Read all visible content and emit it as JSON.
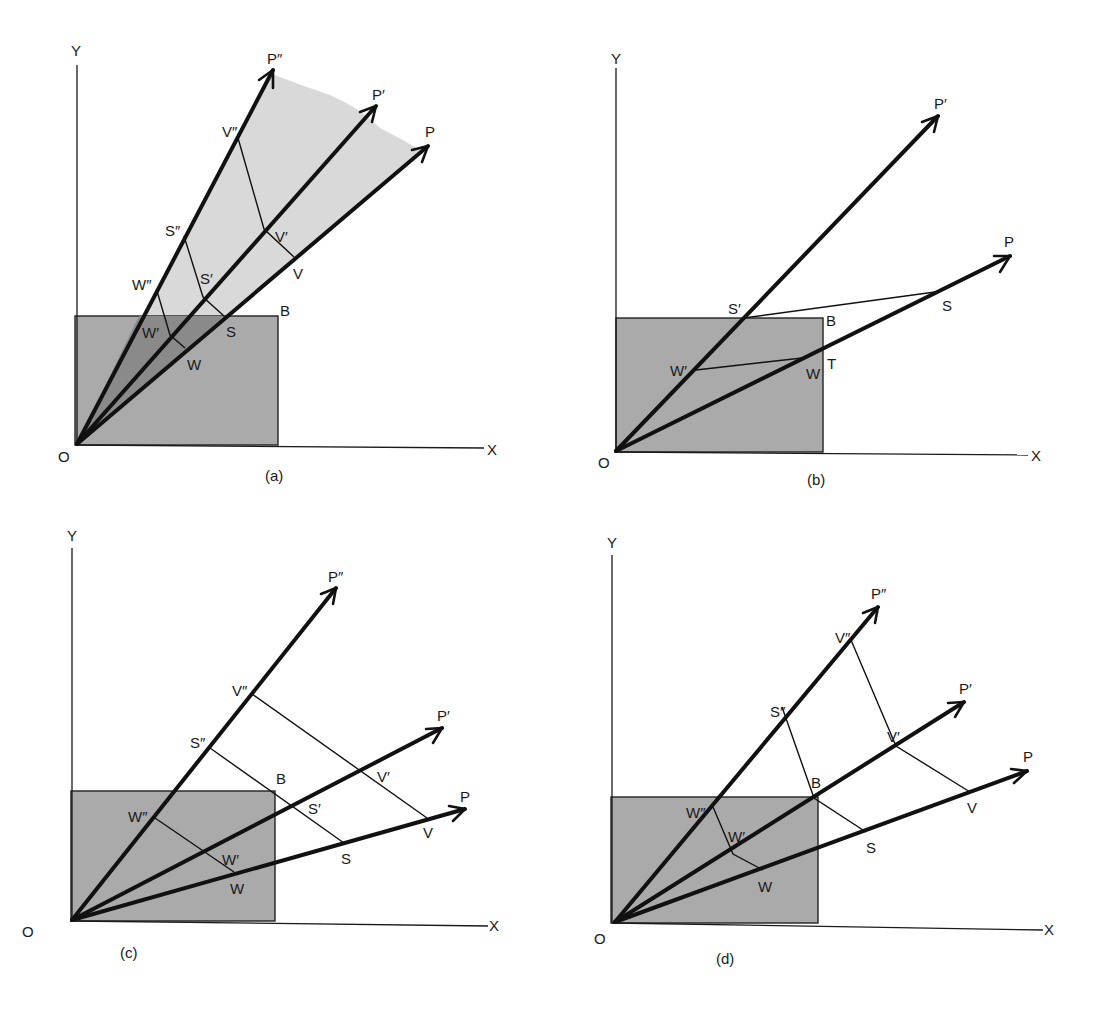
{
  "figure": {
    "panels": [
      {
        "id": "a",
        "caption": "(a)",
        "axes": {
          "x_label": "X",
          "y_label": "Y",
          "origin_label": "O"
        },
        "box_corner_label": "B",
        "rays": [
          "P″",
          "P′",
          "P"
        ],
        "points": {
          "W″": "W″",
          "W′": "W′",
          "W": "W",
          "S″": "S″",
          "S′": "S′",
          "S": "S",
          "V″": "V″",
          "V′": "V′",
          "V": "V"
        },
        "shading": "light fan region above box between P″ and P; darker wedge inside box"
      },
      {
        "id": "b",
        "caption": "(b)",
        "axes": {
          "x_label": "X",
          "y_label": "Y",
          "origin_label": "O"
        },
        "box_corner_label": "B",
        "rays": [
          "P′",
          "P"
        ],
        "points": {
          "S′": "S′",
          "S": "S",
          "W′": "W′",
          "W": "W",
          "T": "T"
        }
      },
      {
        "id": "c",
        "caption": "(c)",
        "axes": {
          "x_label": "X",
          "y_label": "Y",
          "origin_label": "O"
        },
        "box_corner_label": "B",
        "rays": [
          "P″",
          "P′",
          "P"
        ],
        "points": {
          "W″": "W″",
          "W′": "W′",
          "W": "W",
          "S″": "S″",
          "S′": "S′",
          "S": "S",
          "V″": "V″",
          "V′": "V′",
          "V": "V"
        }
      },
      {
        "id": "d",
        "caption": "(d)",
        "axes": {
          "x_label": "X",
          "y_label": "Y",
          "origin_label": "O"
        },
        "box_corner_label": "B",
        "rays": [
          "P″",
          "P′",
          "P"
        ],
        "points": {
          "W″": "W″",
          "W′": "W′",
          "W": "W",
          "S″": "S″",
          "S": "S",
          "V″": "V″",
          "V′": "V′",
          "V": "V"
        }
      }
    ],
    "colors": {
      "box_fill": "#aaaaaa",
      "light_shade": "#d9d9d9",
      "dark_shade": "#8a8a8a",
      "ink": "#111111"
    }
  },
  "labels": {
    "a": {
      "Y": "Y",
      "X": "X",
      "O": "O",
      "B": "B",
      "cap": "(a)",
      "P2": "P″",
      "P1": "P′",
      "P0": "P",
      "W2": "W″",
      "W1": "W′",
      "W0": "W",
      "S2": "S″",
      "S1": "S′",
      "S0": "S",
      "V2": "V″",
      "V1": "V′",
      "V0": "V"
    },
    "b": {
      "Y": "Y",
      "X": "X",
      "O": "O",
      "B": "B",
      "cap": "(b)",
      "P1": "P′",
      "P0": "P",
      "S1": "S′",
      "S0": "S",
      "W1": "W′",
      "W0": "W",
      "T": "T"
    },
    "c": {
      "Y": "Y",
      "X": "X",
      "O": "O",
      "B": "B",
      "cap": "(c)",
      "P2": "P″",
      "P1": "P′",
      "P0": "P",
      "W2": "W″",
      "W1": "W′",
      "W0": "W",
      "S2": "S″",
      "S1": "S′",
      "S0": "S",
      "V2": "V″",
      "V1": "V′",
      "V0": "V"
    },
    "d": {
      "Y": "Y",
      "X": "X",
      "O": "O",
      "B": "B",
      "cap": "(d)",
      "P2": "P″",
      "P1": "P′",
      "P0": "P",
      "W2": "W″",
      "W1": "W′",
      "W0": "W",
      "S2": "S″",
      "S0": "S",
      "V2": "V″",
      "V1": "V′",
      "V0": "V"
    }
  }
}
